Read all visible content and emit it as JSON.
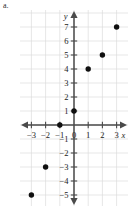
{
  "figure": {
    "part_label": "a.",
    "background_color": "#ffffff",
    "grid_color": "#dcdcdc",
    "axis_color": "#4a4a4a",
    "point_color": "#101010"
  },
  "chart_data": {
    "type": "scatter",
    "title": "",
    "subtitle": "",
    "xlabel": "x",
    "ylabel": "y",
    "xlim": [
      -3.9,
      3.9
    ],
    "ylim": [
      -5.9,
      7.9
    ],
    "grid": true,
    "legend": null,
    "legend_position": "none",
    "x_ticks": [
      -3,
      -2,
      -1,
      0,
      1,
      2,
      3
    ],
    "x_tick_labels": [
      "−3",
      "−2",
      "−1",
      "0",
      "1",
      "2",
      "3"
    ],
    "y_ticks": [
      -5,
      -4,
      -3,
      -2,
      -1,
      1,
      2,
      3,
      4,
      5,
      6,
      7
    ],
    "y_tick_labels": [
      "−5",
      "−4",
      "−3",
      "−2",
      "−1",
      "1",
      "2",
      "3",
      "4",
      "5",
      "6",
      "7"
    ],
    "origin_label": "0",
    "points": [
      {
        "x": -3,
        "y": -5
      },
      {
        "x": -2,
        "y": -3
      },
      {
        "x": -1,
        "y": 0
      },
      {
        "x": 0,
        "y": 1
      },
      {
        "x": 1,
        "y": 4
      },
      {
        "x": 2,
        "y": 5
      },
      {
        "x": 3,
        "y": 7
      }
    ],
    "series": [
      {
        "name": "points",
        "x": [
          -3,
          -2,
          -1,
          0,
          1,
          2,
          3
        ],
        "values": [
          -5,
          -3,
          0,
          1,
          4,
          5,
          7
        ]
      }
    ]
  }
}
